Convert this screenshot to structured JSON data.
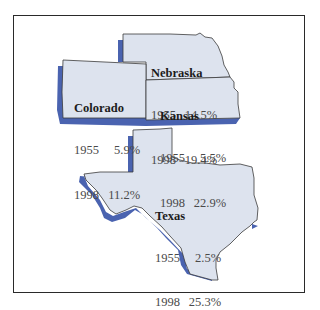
{
  "colors": {
    "state_fill": "#dde3ee",
    "state_outline": "#3a3a3a",
    "shadow": "#4a63b0",
    "frame_border": "#2a2a2a",
    "background": "#ffffff",
    "name_text": "#1c1c1c",
    "value_text": "#4a4a4a"
  },
  "states": [
    {
      "name": "Nebraska",
      "rows": [
        {
          "year": "1955",
          "value": "14.5%"
        },
        {
          "year": "1998",
          "value": "19.4%"
        }
      ]
    },
    {
      "name": "Colorado",
      "rows": [
        {
          "year": "1955",
          "value": "5.9%"
        },
        {
          "year": "1998",
          "value": "11.2%"
        }
      ]
    },
    {
      "name": "Kansas",
      "rows": [
        {
          "year": "1955",
          "value": "5.5%"
        },
        {
          "year": "1998",
          "value": "22.9%"
        }
      ]
    },
    {
      "name": "Texas",
      "rows": [
        {
          "year": "1955",
          "value": "2.5%"
        },
        {
          "year": "1998",
          "value": "25.3%"
        }
      ]
    }
  ]
}
